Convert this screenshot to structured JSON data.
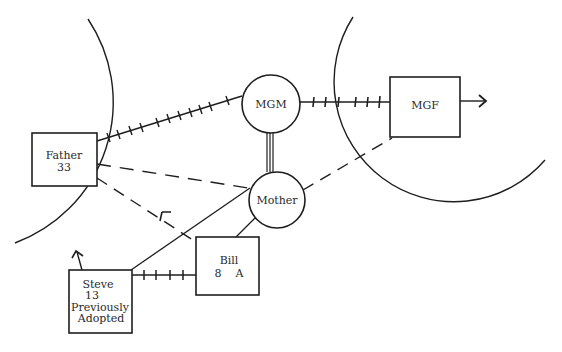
{
  "diagram": {
    "type": "ecomap",
    "colors": {
      "line": "#1e1e1e",
      "text": "#2a2a2a",
      "background": "#ffffff"
    },
    "boundaries": [
      {
        "id": "left-household-boundary",
        "description": "large arc enclosing Father"
      },
      {
        "id": "right-household-boundary",
        "description": "large arc enclosing MGF"
      }
    ],
    "nodes": {
      "father": {
        "shape": "square",
        "lines": [
          "Father",
          "33"
        ]
      },
      "mgm": {
        "shape": "circle",
        "lines": [
          "MGM"
        ]
      },
      "mgf": {
        "shape": "square",
        "lines": [
          "MGF"
        ]
      },
      "mother": {
        "shape": "circle",
        "lines": [
          "Mother"
        ]
      },
      "bill": {
        "shape": "square",
        "lines": [
          "Bill",
          "8    A"
        ]
      },
      "steve": {
        "shape": "square",
        "lines": [
          "Steve",
          "13",
          "Previously",
          "Adopted"
        ]
      }
    },
    "edges": [
      {
        "from": "Father",
        "to": "MGM",
        "style": "stressful (hatched)"
      },
      {
        "from": "MGM",
        "to": "MGF",
        "style": "stressful (hatched)"
      },
      {
        "from": "MGM",
        "to": "Mother",
        "style": "strong (triple line)"
      },
      {
        "from": "Father",
        "to": "Mother",
        "style": "tenuous (dashed)"
      },
      {
        "from": "Father",
        "to": "Bill",
        "style": "tenuous (dashed), arrow toward Father"
      },
      {
        "from": "Mother",
        "to": "MGF",
        "style": "tenuous (dashed)"
      },
      {
        "from": "Mother",
        "to": "Steve",
        "style": "normal (solid)"
      },
      {
        "from": "Mother",
        "to": "Bill",
        "style": "normal (solid)"
      },
      {
        "from": "Steve",
        "to": "Bill",
        "style": "stressful (hatched)"
      },
      {
        "from": "MGF",
        "to": "outside",
        "style": "arrow outward"
      },
      {
        "from": "Steve",
        "to": "outside",
        "style": "arrow upward"
      }
    ]
  }
}
